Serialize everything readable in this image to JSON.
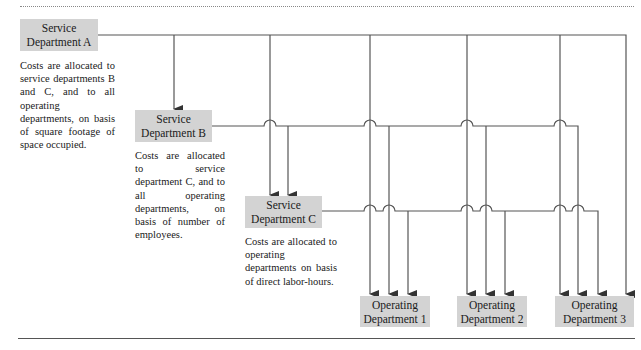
{
  "diagram": {
    "service_departments": [
      {
        "id": "A",
        "line1": "Service",
        "line2": "Department A",
        "description": "Costs are allocated to service departments B and C, and to all operating departments, on basis of square footage of space occupied."
      },
      {
        "id": "B",
        "line1": "Service",
        "line2": "Department B",
        "description": "Costs are allocated to service department C, and to all operating departments, on basis of number of employees."
      },
      {
        "id": "C",
        "line1": "Service",
        "line2": "Department C",
        "description": "Costs are allocated to operating departments on basis of direct labor-hours."
      }
    ],
    "operating_departments": [
      {
        "id": "1",
        "line1": "Operating",
        "line2": "Department 1"
      },
      {
        "id": "2",
        "line1": "Operating",
        "line2": "Department 2"
      },
      {
        "id": "3",
        "line1": "Operating",
        "line2": "Department 3"
      }
    ],
    "colors": {
      "box_fill": "#d3d3d3",
      "line": "#555555"
    }
  }
}
